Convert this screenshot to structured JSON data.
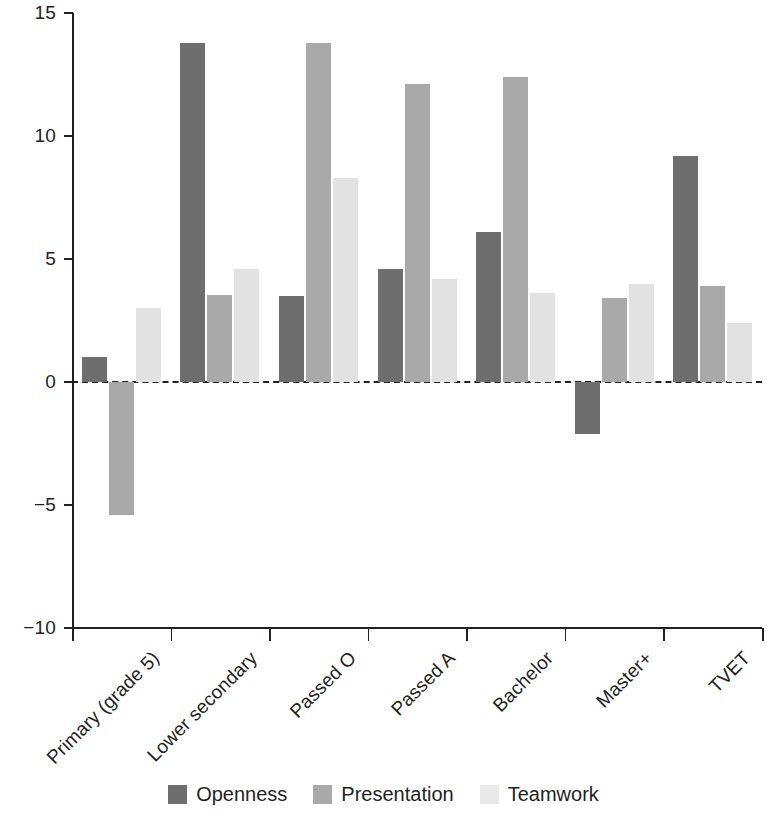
{
  "chart_data": {
    "type": "bar",
    "title": "",
    "subtitle": "",
    "xlabel": "",
    "ylabel": "",
    "ylim": [
      -10,
      15
    ],
    "yticks": [
      15,
      10,
      5,
      0,
      -5,
      -10
    ],
    "ytick_labels": [
      "15",
      "10",
      "5",
      "0",
      "−5",
      "−10"
    ],
    "grid": false,
    "zero_line": true,
    "legend_position": "bottom",
    "categories": [
      "Primary (grade 5)",
      "Lower secondary",
      "Passed O",
      "Passed A",
      "Bachelor",
      "Master+",
      "TVET"
    ],
    "series": [
      {
        "name": "Openness",
        "color": "#6e6e6e",
        "values": [
          1.0,
          13.8,
          3.5,
          4.6,
          6.1,
          -2.1,
          9.2
        ]
      },
      {
        "name": "Presentation",
        "color": "#a9a9a9",
        "values": [
          -5.4,
          3.55,
          13.8,
          12.1,
          12.4,
          3.4,
          3.9
        ]
      },
      {
        "name": "Teamwork",
        "color": "#e2e2e2",
        "values": [
          3.0,
          4.6,
          8.3,
          4.2,
          3.6,
          4.0,
          2.4
        ]
      }
    ]
  },
  "legend": {
    "items": [
      {
        "label": "Openness",
        "swatch": "openness"
      },
      {
        "label": "Presentation",
        "swatch": "presentation"
      },
      {
        "label": "Teamwork",
        "swatch": "teamwork"
      }
    ]
  }
}
